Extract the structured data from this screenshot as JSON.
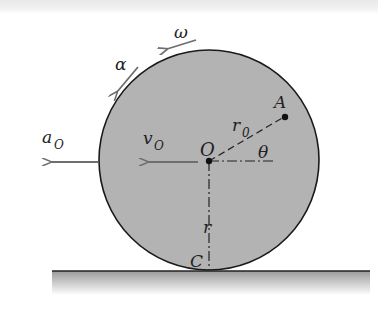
{
  "diagram": {
    "colors": {
      "disk_fill": "#b3b3b3",
      "disk_stroke": "#1a1a1a",
      "arrow": "#6e6e6e",
      "ground_top": "#9a9a9a",
      "ground_line": "#222222",
      "text": "#222222"
    },
    "labels": {
      "omega": "ω",
      "alpha": "α",
      "a_O": "a",
      "a_O_sub": "O",
      "v_O": "v",
      "v_O_sub": "O",
      "center": "O",
      "point_A": "A",
      "r0": "r",
      "r0_sub": "0",
      "theta": "θ",
      "r": "r",
      "contact": "C"
    }
  }
}
